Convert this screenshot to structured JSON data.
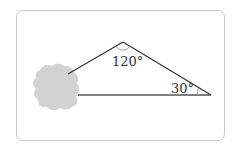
{
  "diagram": {
    "type": "triangle-with-obscured-vertex",
    "angles": {
      "apex": "120°",
      "right": "30°"
    },
    "colors": {
      "frame": "#c8c8c8",
      "lines": "#333333",
      "blob": "#d2d2d2",
      "label": "#333333"
    }
  }
}
